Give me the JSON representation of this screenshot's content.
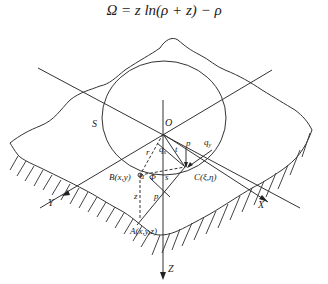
{
  "formula": "Ω = z ln(ρ + z) − ρ",
  "diagram": {
    "labels": {
      "region": "S",
      "origin": "O",
      "point_b": "B(x,y)",
      "point_c": "C(ξ,η)",
      "point_a": "A(x,y,z)",
      "axis_x": "X",
      "axis_y": "Y",
      "axis_z": "Z",
      "load_p_top": "p",
      "load_p_bottom": "p",
      "shear_qx": "q",
      "shear_qx_sub": "x",
      "shear_qy": "q",
      "shear_qy_sub": "y",
      "radius_r": "r",
      "dist_t": "t",
      "dist_s": "s",
      "angle_alpha": "α",
      "angle_phi": "Φ",
      "depth_z": "z"
    }
  }
}
